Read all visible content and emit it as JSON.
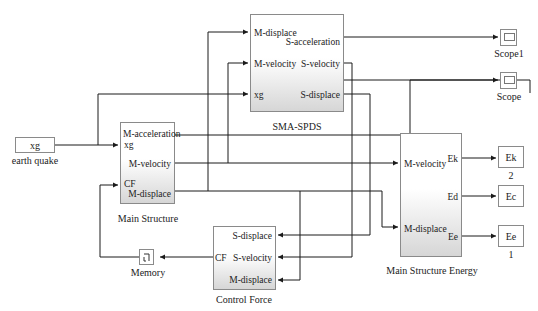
{
  "diagram": {
    "type": "simulink-block-diagram",
    "blocks": {
      "earthquake": {
        "label": "earth quake",
        "text": "xg"
      },
      "main_structure": {
        "label": "Main Structure",
        "inputs": [
          "xg",
          "CF"
        ],
        "outputs": [
          "M-acceleration",
          "M-velocity",
          "M-displace"
        ]
      },
      "sma_spds": {
        "label": "SMA-SPDS",
        "inputs": [
          "M-displace",
          "M-velocity",
          "xg"
        ],
        "outputs": [
          "S-acceleration",
          "S-velocity",
          "S-displace"
        ]
      },
      "control_force": {
        "label": "Control Force",
        "inputs": [
          "S-displace",
          "S-velocity",
          "M-displace"
        ],
        "outputs": [
          "CF"
        ]
      },
      "memory": {
        "label": "Memory"
      },
      "energy": {
        "label": "Main Structure Energy",
        "inputs": [
          "M-velocity",
          "M-displace"
        ],
        "outputs": [
          "Ek",
          "Ed",
          "Ee"
        ]
      },
      "scope1": {
        "label": "Scope1"
      },
      "scope": {
        "label": "Scope"
      },
      "out_ek": {
        "text": "Ek",
        "port_number": "2"
      },
      "out_ec": {
        "text": "Ec"
      },
      "out_ee": {
        "text": "Ee",
        "port_number": "1"
      }
    },
    "colors": {
      "wire": "#1a1a1a",
      "block_border": "#8a8a8a",
      "block_gradient_end": "#d6d6d6"
    }
  }
}
